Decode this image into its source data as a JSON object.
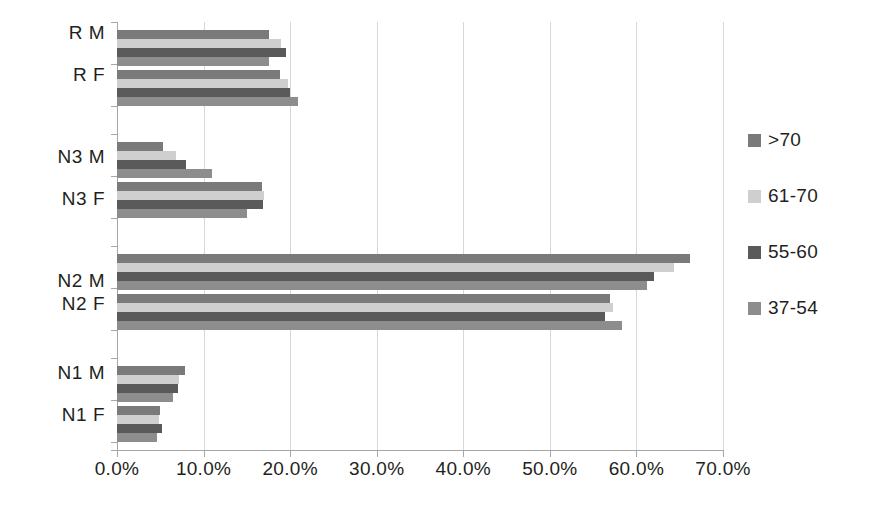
{
  "chart_data": {
    "type": "bar",
    "orientation": "horizontal",
    "title": "",
    "subtitle": "",
    "xlabel": "",
    "ylabel": "",
    "xlim": [
      0,
      70
    ],
    "ylim": null,
    "grid": true,
    "legend_position": "right",
    "xtick_labels": [
      "0.0%",
      "10.0%",
      "20.0%",
      "30.0%",
      "40.0%",
      "50.0%",
      "60.0%",
      "70.0%"
    ],
    "xtick_values": [
      0,
      10,
      20,
      30,
      40,
      50,
      60,
      70
    ],
    "categories": [
      "R M",
      "R F",
      "N3 M",
      "N3 F",
      "N2 M",
      "N2 F",
      "N1 M",
      "N1 F"
    ],
    "series": [
      {
        "name": ">70",
        "color": "#7a7a7a",
        "values": [
          17.5,
          18.8,
          5.3,
          16.8,
          66.2,
          57.0,
          7.8,
          5.0
        ]
      },
      {
        "name": "61-70",
        "color": "#cfcfcf",
        "values": [
          19.0,
          19.7,
          6.8,
          17.0,
          64.3,
          57.3,
          7.2,
          4.8
        ]
      },
      {
        "name": "55-60",
        "color": "#5a5a5a",
        "values": [
          19.5,
          20.0,
          8.0,
          16.9,
          62.0,
          56.4,
          7.0,
          5.2
        ]
      },
      {
        "name": "37-54",
        "color": "#8d8d8d",
        "values": [
          17.6,
          20.9,
          11.0,
          15.0,
          61.2,
          58.3,
          6.5,
          4.6
        ]
      }
    ]
  },
  "legend": {
    "items": [
      {
        "label": ">70",
        "swatch_color": "#7a7a7a",
        "swatch_icon": "legend-square-icon"
      },
      {
        "label": "61-70",
        "swatch_color": "#cfcfcf",
        "swatch_icon": "legend-square-icon"
      },
      {
        "label": "55-60",
        "swatch_color": "#5a5a5a",
        "swatch_icon": "legend-square-icon"
      },
      {
        "label": "37-54",
        "swatch_color": "#8d8d8d",
        "swatch_icon": "legend-square-icon"
      }
    ]
  },
  "axes": {
    "x": {
      "labels": [
        "0.0%",
        "10.0%",
        "20.0%",
        "30.0%",
        "40.0%",
        "50.0%",
        "60.0%",
        "70.0%"
      ]
    },
    "y": {
      "labels": [
        "R M",
        "R F",
        "N3 M",
        "N3 F",
        "N2 M",
        "N2 F",
        "N1 M",
        "N1 F"
      ]
    }
  },
  "colors": {
    "gridline": "#d7d7d7",
    "axis": "#a6a6a6",
    "text": "#231f20",
    "background": "#ffffff"
  }
}
